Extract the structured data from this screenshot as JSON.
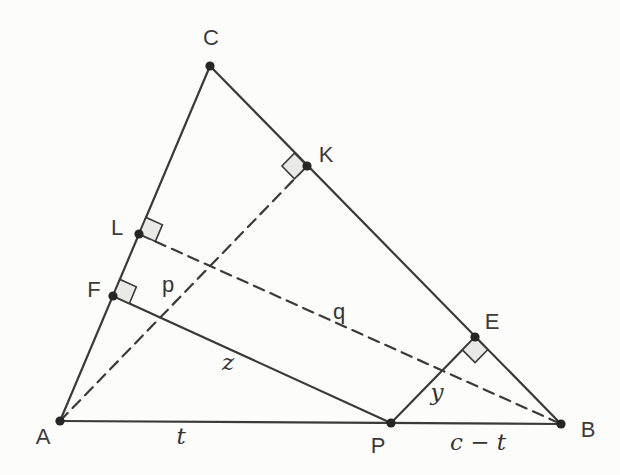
{
  "diagram": {
    "canvas": {
      "width": 620,
      "height": 475,
      "background": "#fcfcfa"
    },
    "style": {
      "line_color": "#3a3a3a",
      "dot_color": "#262626",
      "square_fill": "#e9e9e5",
      "square_stroke": "#3a3a3a",
      "solid_width": 2.2,
      "dashed_width": 2.2,
      "dash_pattern": "11 7",
      "dot_radius": 4.6,
      "square_size": 18
    },
    "points": [
      {
        "id": "A",
        "label": "A",
        "x": 60,
        "y": 421,
        "label_x": 43,
        "label_y": 436
      },
      {
        "id": "B",
        "label": "B",
        "x": 561,
        "y": 424,
        "label_x": 588,
        "label_y": 429
      },
      {
        "id": "C",
        "label": "C",
        "x": 210,
        "y": 66,
        "label_x": 211,
        "label_y": 37
      },
      {
        "id": "P",
        "label": "P",
        "x": 391,
        "y": 423,
        "label_x": 378,
        "label_y": 445
      },
      {
        "id": "F",
        "label": "F",
        "x": 113,
        "y": 296,
        "label_x": 94,
        "label_y": 289
      },
      {
        "id": "L",
        "label": "L",
        "x": 139,
        "y": 234,
        "label_x": 117,
        "label_y": 227
      },
      {
        "id": "K",
        "label": "K",
        "x": 307,
        "y": 166,
        "label_x": 326,
        "label_y": 154
      },
      {
        "id": "E",
        "label": "E",
        "x": 475,
        "y": 337,
        "label_x": 492,
        "label_y": 321
      }
    ],
    "segments": [
      {
        "id": "AB",
        "from": "A",
        "to": "B",
        "style": "solid"
      },
      {
        "id": "AC",
        "from": "A",
        "to": "C",
        "style": "solid"
      },
      {
        "id": "CB",
        "from": "C",
        "to": "B",
        "style": "solid"
      },
      {
        "id": "FP",
        "from": "F",
        "to": "P",
        "style": "solid"
      },
      {
        "id": "PE",
        "from": "P",
        "to": "E",
        "style": "solid"
      },
      {
        "id": "AK",
        "from": "A",
        "to": "K",
        "style": "dashed"
      },
      {
        "id": "LB",
        "from": "L",
        "to": "B",
        "style": "dashed"
      }
    ],
    "right_angles": [
      {
        "at": "F",
        "toward1": "C",
        "toward2": "P"
      },
      {
        "at": "L",
        "toward1": "C",
        "toward2": "B"
      },
      {
        "at": "K",
        "toward1": "C",
        "toward2": "A"
      },
      {
        "at": "E",
        "toward1": "P",
        "toward2": "B"
      }
    ],
    "measure_labels": [
      {
        "id": "p",
        "text": "p",
        "x": 168,
        "y": 284,
        "font": "sans"
      },
      {
        "id": "q",
        "text": "q",
        "x": 339,
        "y": 311,
        "font": "sans"
      },
      {
        "id": "z",
        "text": "z",
        "x": 228,
        "y": 362,
        "font": "math"
      },
      {
        "id": "y",
        "text": "y",
        "x": 437,
        "y": 392,
        "font": "math"
      },
      {
        "id": "t",
        "text": "t",
        "x": 181,
        "y": 436,
        "font": "math"
      },
      {
        "id": "c-t",
        "text": "c − t",
        "x": 478,
        "y": 442,
        "font": "math"
      }
    ]
  }
}
